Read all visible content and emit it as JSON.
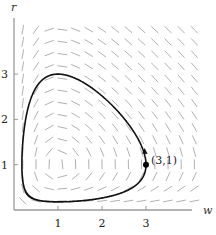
{
  "figure": {
    "type": "phase-plane",
    "axes": {
      "x_label": "w",
      "y_label": "r",
      "x_ticks": [
        "1",
        "2",
        "3"
      ],
      "y_ticks": [
        "1",
        "2",
        "3"
      ],
      "x_range": [
        0,
        4.4
      ],
      "y_range": [
        0,
        4.2
      ]
    },
    "point": {
      "label": "(3,1)",
      "w": 3,
      "r": 1
    },
    "equilibrium": {
      "w": 1,
      "r": 1
    },
    "colors": {
      "axis": "#9a9a9a",
      "field": "#a8a8a8",
      "trajectory": "#111111"
    }
  }
}
